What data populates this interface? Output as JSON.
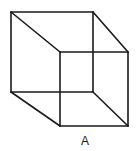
{
  "diagram": {
    "label": "A",
    "label_position": {
      "x": 85,
      "y": 141
    },
    "stroke_color": "#1a1a1a",
    "stroke_width": 1.6,
    "front_face": {
      "tl": [
        11,
        12
      ],
      "tr": [
        93,
        12
      ],
      "br": [
        93,
        92
      ],
      "bl": [
        11,
        92
      ]
    },
    "back_face": {
      "tl": [
        60,
        52
      ],
      "tr": [
        128,
        52
      ],
      "br": [
        128,
        126
      ],
      "bl": [
        60,
        126
      ]
    }
  }
}
